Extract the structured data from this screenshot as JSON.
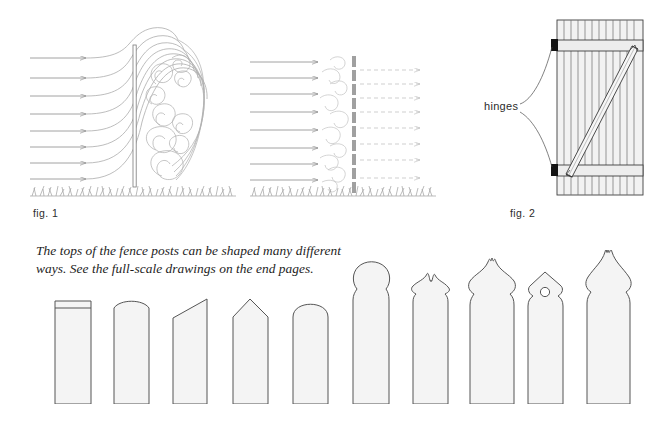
{
  "page": {
    "background_color": "#ffffff",
    "width": 667,
    "height": 429
  },
  "figures": [
    {
      "id": "fig1",
      "label": "fig. 1",
      "name": "solid-fence-wind-turbulence-diagram",
      "description": "Wind streamlines striking a solid fence panel and curling into large turbulent eddies on the leeward side, above a grass ground line."
    },
    {
      "id": "fig1b",
      "label": "",
      "name": "spaced-fence-wind-filter-diagram",
      "description": "Wind streamlines passing through a spaced-picket fence, breaking into small eddies and continuing as reduced dashed-arrow flow downwind, above a grass ground line."
    },
    {
      "id": "fig2",
      "label": "fig. 2",
      "name": "gate-bracing-diagram",
      "description": "Board gate elevation with top and bottom rails, a diagonal brace running from the lower hinge side up to the opposite top corner, and two hinges on the left stile."
    }
  ],
  "annotations": {
    "hinges_label": "hinges"
  },
  "caption": {
    "text": "The tops of the fence posts can be shaped many different ways. See the full-scale drawings on the end pages."
  },
  "post_gallery": {
    "name": "fence-post-top-profiles",
    "count": 10,
    "posts": [
      {
        "index": 1,
        "style_name": "square-chamfered-top",
        "label": "square with chamfer line"
      },
      {
        "index": 2,
        "style_name": "segmental-arched-top",
        "label": "segmental arch"
      },
      {
        "index": 3,
        "style_name": "angled-bevel-top",
        "label": "single angled bevel"
      },
      {
        "index": 4,
        "style_name": "gable-point-top",
        "label": "gable point"
      },
      {
        "index": 5,
        "style_name": "full-round-top",
        "label": "full round"
      },
      {
        "index": 6,
        "style_name": "ball-finial-top",
        "label": "ball finial"
      },
      {
        "index": 7,
        "style_name": "small-ogee-spire-top",
        "label": "small ogee spire"
      },
      {
        "index": 8,
        "style_name": "tall-onion-spire-top",
        "label": "tall onion spire"
      },
      {
        "index": 9,
        "style_name": "pierced-gable-top",
        "label": "pierced gable with bored hole"
      },
      {
        "index": 10,
        "style_name": "tall-flame-finial-top",
        "label": "tall flame finial"
      }
    ]
  },
  "colors": {
    "ink": "#231f20",
    "line_light": "#9a9a9a",
    "line_mid": "#6f6f6f",
    "line_dark": "#3a3a3a",
    "fill_post": "#f4f4f4",
    "fill_rail": "#ececec",
    "hinge_black": "#141414",
    "dashed_flow": "#b9b9b9"
  }
}
